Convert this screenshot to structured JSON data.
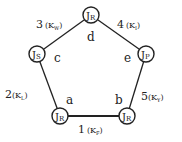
{
  "diagram": {
    "type": "pentagon-linkage",
    "joints": [
      {
        "id": "d",
        "label": "J",
        "sub": "R",
        "vertex_label": "d",
        "x": 91,
        "y": 15,
        "lx": 91,
        "ly": 37
      },
      {
        "id": "c",
        "label": "J",
        "sub": "S",
        "vertex_label": "c",
        "x": 37,
        "y": 54,
        "lx": 57,
        "ly": 58
      },
      {
        "id": "e",
        "label": "J",
        "sub": "P",
        "vertex_label": "e",
        "x": 146,
        "y": 54,
        "lx": 128,
        "ly": 58
      },
      {
        "id": "a",
        "label": "J",
        "sub": "R",
        "vertex_label": "a",
        "x": 60,
        "y": 116,
        "lx": 70,
        "ly": 101
      },
      {
        "id": "b",
        "label": "J",
        "sub": "R",
        "vertex_label": "b",
        "x": 127,
        "y": 116,
        "lx": 118,
        "ly": 101
      }
    ],
    "edges": [
      {
        "num": "1",
        "k": "K",
        "sub": "F",
        "from": "a",
        "to": "b",
        "lx": 80,
        "ly": 131
      },
      {
        "num": "2",
        "k": "K",
        "sub": "L",
        "from": "c",
        "to": "a",
        "lx": 6,
        "ly": 94
      },
      {
        "num": "3",
        "k": "K",
        "sub": "W",
        "from": "c",
        "to": "d",
        "lx": 36,
        "ly": 24
      },
      {
        "num": "4",
        "k": "K",
        "sub": "I",
        "from": "d",
        "to": "e",
        "lx": 115,
        "ly": 24
      },
      {
        "num": "5",
        "k": "K",
        "sub": "Y",
        "from": "e",
        "to": "b",
        "lx": 141,
        "ly": 98
      }
    ]
  },
  "text": {
    "joint_d": {
      "main": "J",
      "sub": "R",
      "vertex": "d"
    },
    "joint_c": {
      "main": "J",
      "sub": "S",
      "vertex": "c"
    },
    "joint_e": {
      "main": "J",
      "sub": "P",
      "vertex": "e"
    },
    "joint_a": {
      "main": "J",
      "sub": "R",
      "vertex": "a"
    },
    "joint_b": {
      "main": "J",
      "sub": "R",
      "vertex": "b"
    },
    "edge_1": {
      "num": "1",
      "open": "(K",
      "sub": "F",
      "close": ")"
    },
    "edge_2": {
      "num": "2",
      "open": "(K",
      "sub": "L",
      "close": ")"
    },
    "edge_3": {
      "num": "3",
      "open": "(K",
      "sub": "W",
      "close": ")"
    },
    "edge_4": {
      "num": "4",
      "open": "(K",
      "sub": "I",
      "close": ")"
    },
    "edge_5": {
      "num": "5",
      "open": "(K",
      "sub": "Y",
      "close": ")"
    }
  }
}
